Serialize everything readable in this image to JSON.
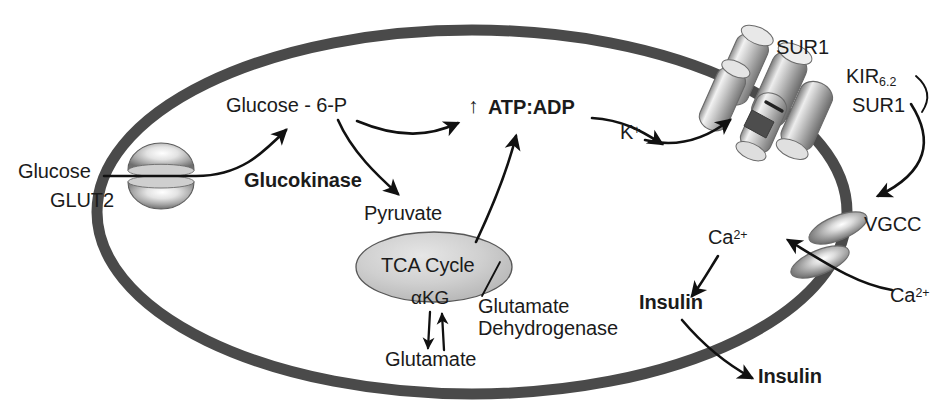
{
  "figure": {
    "kind": "biology-pathway-diagram",
    "colors": {
      "membrane": "#4a4a4a",
      "protein_light": "#d9d9d9",
      "protein_mid": "#9a9a9a",
      "protein_dark": "#5a5a5a",
      "tca_fill": "#c9c9c9",
      "arrow": "#111111",
      "text": "#1b1b1b",
      "background": "#ffffff"
    }
  },
  "labels": {
    "glucose_outside": "Glucose",
    "glut2": "GLUT2",
    "glucose_6_p": "Glucose - 6-P",
    "glucokinase": "Glucokinase",
    "atp_adp_arrow": "↑",
    "atp_adp": "ATP:ADP",
    "k_plus_base": "K",
    "k_plus_sup": "+",
    "pyruvate": "Pyruvate",
    "tca_cycle": "TCA Cycle",
    "akg": "αKG",
    "glutamate": "Glutamate",
    "glutamate_dehydrogenase_line1": "Glutamate",
    "glutamate_dehydrogenase_line2": "Dehydrogenase",
    "sur1_top": "SUR1",
    "kir_base": "KIR",
    "kir_sub": "6.2",
    "sur1_right": "SUR1",
    "vgcc": "VGCC",
    "ca_outside_base": "Ca",
    "ca_outside_sup": "2+",
    "ca_inside_base": "Ca",
    "ca_inside_sup": "2+",
    "insulin_inside": "Insulin",
    "insulin_secreted": "Insulin"
  },
  "structures": {
    "cell_membrane": "cell-membrane-ellipse",
    "glut2_transporter": "glut2-transporter",
    "katp_channel": "katp-channel-complex",
    "vgcc_channel": "vgcc-channel",
    "tca_ellipse": "tca-cycle-ellipse"
  },
  "arrows": [
    {
      "name": "glucose-into-cell",
      "from": "Glucose",
      "to": "GLUT2"
    },
    {
      "name": "glucose-to-g6p",
      "from": "Glucose",
      "to": "Glucose - 6-P"
    },
    {
      "name": "g6p-to-atpadp",
      "from": "Glucose - 6-P",
      "to": "ATP:ADP"
    },
    {
      "name": "g6p-to-pyruvate",
      "from": "Glucose - 6-P",
      "to": "Pyruvate"
    },
    {
      "name": "tca-to-atpadp",
      "from": "TCA Cycle",
      "to": "ATP:ADP"
    },
    {
      "name": "atpadp-to-katp",
      "from": "ATP:ADP",
      "to": "K-ATP channel"
    },
    {
      "name": "k-efflux",
      "from": "K+",
      "to": "K-ATP channel"
    },
    {
      "name": "depolarization-to-vgcc",
      "from": "KIR6.2/SUR1",
      "to": "VGCC"
    },
    {
      "name": "ca-influx",
      "from": "Ca2+ outside",
      "to": "Ca2+ inside"
    },
    {
      "name": "ca-to-insulin",
      "from": "Ca2+",
      "to": "Insulin"
    },
    {
      "name": "insulin-secretion",
      "from": "Insulin",
      "to": "Insulin secreted"
    },
    {
      "name": "akg-to-glutamate",
      "from": "αKG",
      "to": "Glutamate"
    },
    {
      "name": "glutamate-to-akg",
      "from": "Glutamate",
      "to": "αKG"
    }
  ]
}
